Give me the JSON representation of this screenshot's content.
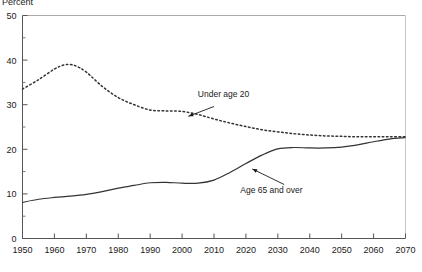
{
  "chart_data": {
    "type": "line",
    "title": "",
    "xlabel": "",
    "ylabel": "Percent",
    "xlim": [
      1950,
      2070
    ],
    "ylim": [
      0,
      50
    ],
    "grid": false,
    "legend_position": "inline-annotations",
    "xticks": [
      1950,
      1960,
      1970,
      1980,
      1990,
      2000,
      2010,
      2020,
      2030,
      2040,
      2050,
      2060,
      2070
    ],
    "xtick_labels": [
      "1950",
      "1960",
      "1970",
      "1980",
      "1990",
      "2000",
      "2010",
      "2020",
      "2030",
      "2040",
      "2050",
      "2060",
      "2070"
    ],
    "yticks": [
      0,
      10,
      20,
      30,
      40,
      50
    ],
    "ytick_labels": [
      "0",
      "10",
      "20",
      "30",
      "40",
      "50"
    ],
    "yminor_ticks": [
      5,
      15,
      25,
      35,
      45
    ],
    "series": [
      {
        "name": "Under age 20",
        "style": "dotted",
        "color": "#333333",
        "x": [
          1950,
          1955,
          1960,
          1963,
          1965,
          1967,
          1970,
          1975,
          1980,
          1985,
          1990,
          1995,
          2000,
          2005,
          2010,
          2015,
          2020,
          2025,
          2030,
          2035,
          2040,
          2045,
          2050,
          2055,
          2060,
          2065,
          2070
        ],
        "values": [
          33.5,
          35.6,
          38.0,
          38.9,
          39.0,
          38.6,
          37.3,
          34.1,
          31.6,
          30.0,
          28.8,
          28.6,
          28.5,
          27.8,
          26.8,
          25.9,
          25.1,
          24.4,
          23.9,
          23.5,
          23.2,
          23.0,
          22.9,
          22.8,
          22.8,
          22.8,
          22.8
        ]
      },
      {
        "name": "Age 65 and over",
        "style": "solid",
        "color": "#333333",
        "x": [
          1950,
          1955,
          1960,
          1965,
          1970,
          1975,
          1980,
          1985,
          1990,
          1995,
          2000,
          2005,
          2010,
          2015,
          2020,
          2025,
          2030,
          2035,
          2040,
          2045,
          2050,
          2055,
          2060,
          2065,
          2070
        ],
        "values": [
          8.1,
          8.8,
          9.2,
          9.5,
          9.9,
          10.5,
          11.3,
          11.9,
          12.5,
          12.6,
          12.4,
          12.4,
          13.1,
          14.8,
          16.8,
          18.7,
          20.1,
          20.4,
          20.3,
          20.3,
          20.5,
          21.0,
          21.7,
          22.3,
          22.6
        ]
      }
    ],
    "annotations": [
      {
        "text": "Under age 20",
        "series": "Under age 20",
        "label_x": 2013,
        "label_y": 31.8,
        "arrow_from_x": 2010,
        "arrow_from_y": 29.6,
        "arrow_to_x": 2002,
        "arrow_to_y": 27.4
      },
      {
        "text": "Age 65 and over",
        "series": "Age 65 and over",
        "label_x": 2028,
        "label_y": 10.2,
        "arrow_from_x": 2032,
        "arrow_from_y": 12.1,
        "arrow_to_x": 2022,
        "arrow_to_y": 15.6
      }
    ]
  }
}
